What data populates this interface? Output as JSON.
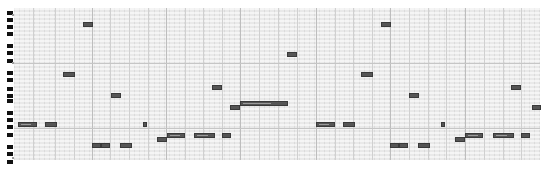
{
  "app": {
    "view": "piano-roll"
  },
  "keyboard": {
    "black_key_rows": [
      11,
      18,
      25,
      32,
      44,
      51,
      59,
      71,
      78,
      87,
      94,
      99,
      111,
      118,
      125,
      133,
      145,
      152,
      160
    ],
    "octave_label_rows": [
      14,
      62,
      157
    ]
  },
  "grid": {
    "left": 14,
    "top": 8,
    "width": 526,
    "height": 152,
    "bar_lines_x": [
      92,
      166,
      240,
      316,
      390,
      465
    ],
    "beat_lines_x": [
      33,
      55,
      74,
      110,
      129,
      148,
      185,
      203,
      222,
      259,
      278,
      297,
      335,
      353,
      372,
      409,
      428,
      446,
      484,
      503,
      521
    ],
    "octave_lines_y": [
      63,
      128
    ]
  },
  "colors": {
    "grid_bg": "#e9e9e9",
    "note_fill": "#555555",
    "note_border": "#3a3a3a",
    "black_key": "#111111"
  },
  "notes": [
    {
      "x": 83,
      "y": 22,
      "w": 10
    },
    {
      "x": 381,
      "y": 22,
      "w": 10
    },
    {
      "x": 287,
      "y": 52,
      "w": 10
    },
    {
      "x": 63,
      "y": 72,
      "w": 12
    },
    {
      "x": 361,
      "y": 72,
      "w": 12
    },
    {
      "x": 212,
      "y": 85,
      "w": 10
    },
    {
      "x": 511,
      "y": 85,
      "w": 10
    },
    {
      "x": 111,
      "y": 93,
      "w": 10
    },
    {
      "x": 409,
      "y": 93,
      "w": 10
    },
    {
      "x": 240,
      "y": 101,
      "w": 48
    },
    {
      "x": 230,
      "y": 105,
      "w": 10
    },
    {
      "x": 532,
      "y": 105,
      "w": 9
    },
    {
      "x": 18,
      "y": 122,
      "w": 19
    },
    {
      "x": 45,
      "y": 122,
      "w": 12
    },
    {
      "x": 143,
      "y": 122,
      "w": 4
    },
    {
      "x": 316,
      "y": 122,
      "w": 19
    },
    {
      "x": 343,
      "y": 122,
      "w": 12
    },
    {
      "x": 441,
      "y": 122,
      "w": 4
    },
    {
      "x": 167,
      "y": 133,
      "w": 18
    },
    {
      "x": 194,
      "y": 133,
      "w": 21
    },
    {
      "x": 222,
      "y": 133,
      "w": 9
    },
    {
      "x": 465,
      "y": 133,
      "w": 18
    },
    {
      "x": 493,
      "y": 133,
      "w": 21
    },
    {
      "x": 521,
      "y": 133,
      "w": 9
    },
    {
      "x": 157,
      "y": 137,
      "w": 10
    },
    {
      "x": 455,
      "y": 137,
      "w": 10
    },
    {
      "x": 92,
      "y": 143,
      "w": 9
    },
    {
      "x": 101,
      "y": 143,
      "w": 9
    },
    {
      "x": 120,
      "y": 143,
      "w": 12
    },
    {
      "x": 390,
      "y": 143,
      "w": 9
    },
    {
      "x": 399,
      "y": 143,
      "w": 9
    },
    {
      "x": 418,
      "y": 143,
      "w": 12
    }
  ]
}
